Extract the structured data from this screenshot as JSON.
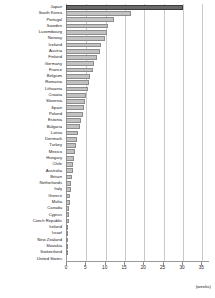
{
  "chart_data": {
    "type": "bar",
    "orientation": "horizontal",
    "title": "",
    "subtitle": "",
    "xlabel": "(weeks)",
    "ylabel": "",
    "xlim": [
      0,
      37
    ],
    "grid": true,
    "legend": null,
    "xticks": [
      0,
      5,
      10,
      15,
      20,
      25,
      30,
      35
    ],
    "xtick_labels": [
      "0",
      "5",
      "10",
      "15",
      "20",
      "25",
      "30",
      "35"
    ],
    "highlight_category": "Japan",
    "colors": {
      "bar": "#c2c2c2",
      "bar_edge": "#8d8d8d",
      "bar_highlight": "#6a6a6a",
      "bar_highlight_edge": "#3d3d3d",
      "grid": "#c9c9c9",
      "axis": "#9a9a9a",
      "text": "#1a1a1a"
    },
    "categories": [
      "Japan",
      "South Korea",
      "Portugal",
      "Sweden",
      "Luxembourg",
      "Norway",
      "Iceland",
      "Austria",
      "Finland",
      "Germany",
      "France",
      "Belgium",
      "Romania",
      "Lithuania",
      "Croatia",
      "Slovenia",
      "Spain",
      "Poland",
      "Estonia",
      "Bulgaria",
      "Latvia",
      "Denmark",
      "Turkey",
      "Mexico",
      "Hungary",
      "Chile",
      "Australia",
      "Britain",
      "Netherlands",
      "Italy",
      "Greece",
      "Malta",
      "Canada",
      "Cyprus",
      "Czech Republic",
      "Ireland",
      "Israel",
      "New Zealand",
      "Slovakia",
      "Switzerland",
      "United States"
    ],
    "values": [
      30.4,
      16.8,
      12.5,
      10.9,
      10.5,
      10.0,
      9.0,
      8.8,
      7.9,
      7.3,
      7.0,
      6.3,
      6.0,
      5.6,
      5.2,
      5.0,
      4.7,
      4.4,
      4.0,
      3.6,
      3.2,
      2.9,
      2.6,
      2.3,
      2.1,
      1.9,
      1.7,
      1.5,
      1.4,
      1.2,
      1.1,
      1.0,
      0.9,
      0.8,
      0.7,
      0.6,
      0.5,
      0.4,
      0.3,
      0.2,
      0.0
    ]
  }
}
